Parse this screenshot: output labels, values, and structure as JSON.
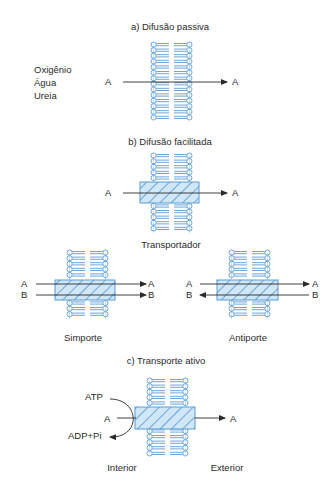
{
  "colors": {
    "membrane": "#5b9bd5",
    "transporter_fill": "#cfe7f7",
    "transporter_hatch": "#3d7fc0",
    "arrow": "#2a2a2a",
    "text": "#2a2a2a"
  },
  "sections": {
    "passive": {
      "title": "a) Difusão passiva",
      "molecules": [
        "Oxigênio",
        "Água",
        "Ureia"
      ],
      "left_label": "A",
      "right_label": "A"
    },
    "facilitated": {
      "title": "b) Difusão facilitada",
      "left_label": "A",
      "right_label": "A",
      "transporter_label": "Transportador"
    },
    "symport": {
      "label": "Simporte",
      "left_labels": [
        "A",
        "B"
      ],
      "right_labels": [
        "A",
        "B"
      ],
      "directions": [
        "right",
        "right"
      ]
    },
    "antiport": {
      "label": "Antiporte",
      "left_labels": [
        "A",
        "B"
      ],
      "right_labels": [
        "A",
        "B"
      ],
      "directions": [
        "right",
        "left"
      ]
    },
    "active": {
      "title": "c) Transporte ativo",
      "atp_label": "ATP",
      "left_label": "A",
      "adp_label": "ADP+Pi",
      "right_label": "A",
      "interior_label": "Interior",
      "exterior_label": "Exterior"
    }
  }
}
